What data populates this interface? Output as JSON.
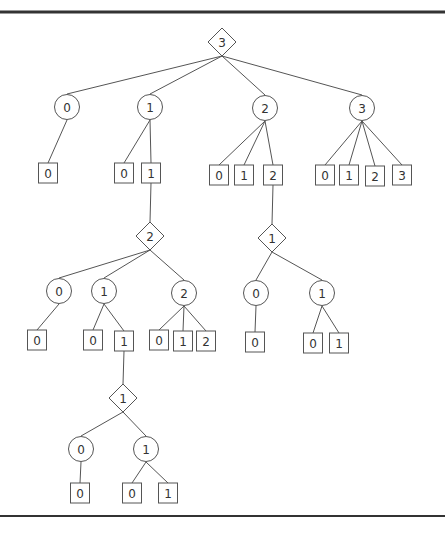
{
  "diagram": {
    "type": "game-tree",
    "legend_shapes": {
      "diamond": "decision-node",
      "circle": "chance-node",
      "square": "leaf-node"
    },
    "rules": [
      {
        "y": 12,
        "x1": 0,
        "x2": 445,
        "width": 3
      },
      {
        "y": 516,
        "x1": 0,
        "x2": 445,
        "width": 2
      }
    ],
    "nodes": [
      {
        "id": "d0",
        "shape": "diamond",
        "label": "3",
        "x": 222,
        "y": 42
      },
      {
        "id": "c0",
        "shape": "circle",
        "label": "0",
        "x": 67,
        "y": 107,
        "parent": "d0"
      },
      {
        "id": "c1",
        "shape": "circle",
        "label": "1",
        "x": 150,
        "y": 107,
        "parent": "d0"
      },
      {
        "id": "c2",
        "shape": "circle",
        "label": "2",
        "x": 265,
        "y": 108,
        "parent": "d0"
      },
      {
        "id": "c3",
        "shape": "circle",
        "label": "3",
        "x": 362,
        "y": 108,
        "parent": "d0"
      },
      {
        "id": "b00",
        "shape": "square",
        "label": "0",
        "x": 48,
        "y": 173,
        "parent": "c0"
      },
      {
        "id": "b10",
        "shape": "square",
        "label": "0",
        "x": 124,
        "y": 173,
        "parent": "c1"
      },
      {
        "id": "b11",
        "shape": "square",
        "label": "1",
        "x": 151,
        "y": 173,
        "parent": "c1"
      },
      {
        "id": "b20",
        "shape": "square",
        "label": "0",
        "x": 219,
        "y": 175,
        "parent": "c2"
      },
      {
        "id": "b21",
        "shape": "square",
        "label": "1",
        "x": 244,
        "y": 175,
        "parent": "c2"
      },
      {
        "id": "b22",
        "shape": "square",
        "label": "2",
        "x": 273,
        "y": 175,
        "parent": "c2"
      },
      {
        "id": "b30",
        "shape": "square",
        "label": "0",
        "x": 325,
        "y": 175,
        "parent": "c3"
      },
      {
        "id": "b31",
        "shape": "square",
        "label": "1",
        "x": 349,
        "y": 175,
        "parent": "c3"
      },
      {
        "id": "b32",
        "shape": "square",
        "label": "2",
        "x": 375,
        "y": 176,
        "parent": "c3"
      },
      {
        "id": "b33",
        "shape": "square",
        "label": "3",
        "x": 402,
        "y": 175,
        "parent": "c3"
      },
      {
        "id": "d1",
        "shape": "diamond",
        "label": "2",
        "x": 150,
        "y": 236,
        "parent": "b11"
      },
      {
        "id": "d2",
        "shape": "diamond",
        "label": "1",
        "x": 272,
        "y": 238,
        "parent": "b22"
      },
      {
        "id": "c10",
        "shape": "circle",
        "label": "0",
        "x": 59,
        "y": 291,
        "parent": "d1"
      },
      {
        "id": "c11",
        "shape": "circle",
        "label": "1",
        "x": 104,
        "y": 291,
        "parent": "d1"
      },
      {
        "id": "c12",
        "shape": "circle",
        "label": "2",
        "x": 184,
        "y": 293,
        "parent": "d1"
      },
      {
        "id": "c20",
        "shape": "circle",
        "label": "0",
        "x": 256,
        "y": 293,
        "parent": "d2"
      },
      {
        "id": "c21",
        "shape": "circle",
        "label": "1",
        "x": 322,
        "y": 293,
        "parent": "d2"
      },
      {
        "id": "b100",
        "shape": "square",
        "label": "0",
        "x": 37,
        "y": 340,
        "parent": "c10"
      },
      {
        "id": "b110",
        "shape": "square",
        "label": "0",
        "x": 93,
        "y": 340,
        "parent": "c11"
      },
      {
        "id": "b111",
        "shape": "square",
        "label": "1",
        "x": 124,
        "y": 341,
        "parent": "c11"
      },
      {
        "id": "b120",
        "shape": "square",
        "label": "0",
        "x": 159,
        "y": 340,
        "parent": "c12"
      },
      {
        "id": "b121",
        "shape": "square",
        "label": "1",
        "x": 183,
        "y": 341,
        "parent": "c12"
      },
      {
        "id": "b122",
        "shape": "square",
        "label": "2",
        "x": 206,
        "y": 341,
        "parent": "c12"
      },
      {
        "id": "b200",
        "shape": "square",
        "label": "0",
        "x": 255,
        "y": 342,
        "parent": "c20"
      },
      {
        "id": "b210",
        "shape": "square",
        "label": "0",
        "x": 313,
        "y": 343,
        "parent": "c21"
      },
      {
        "id": "b211",
        "shape": "square",
        "label": "1",
        "x": 339,
        "y": 343,
        "parent": "c21"
      },
      {
        "id": "d3",
        "shape": "diamond",
        "label": "1",
        "x": 123,
        "y": 398,
        "parent": "b111"
      },
      {
        "id": "c30",
        "shape": "circle",
        "label": "0",
        "x": 81,
        "y": 449,
        "parent": "d3"
      },
      {
        "id": "c31",
        "shape": "circle",
        "label": "1",
        "x": 146,
        "y": 449,
        "parent": "d3"
      },
      {
        "id": "b300",
        "shape": "square",
        "label": "0",
        "x": 80,
        "y": 493,
        "parent": "c30"
      },
      {
        "id": "b310",
        "shape": "square",
        "label": "0",
        "x": 132,
        "y": 493,
        "parent": "c31"
      },
      {
        "id": "b311",
        "shape": "square",
        "label": "1",
        "x": 168,
        "y": 493,
        "parent": "c31"
      }
    ]
  }
}
